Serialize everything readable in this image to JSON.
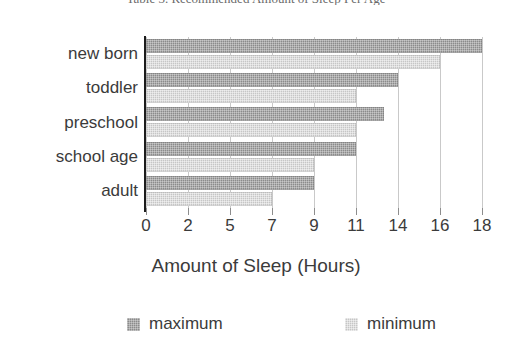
{
  "chart_data": {
    "type": "bar",
    "orientation": "horizontal",
    "title": "Table 3. Recommended Amount of Sleep Per Age",
    "xlabel": "Amount of Sleep (Hours)",
    "ylabel": "",
    "categories": [
      "new born",
      "toddler",
      "preschool",
      "school age",
      "adult"
    ],
    "series": [
      {
        "name": "maximum",
        "values": [
          18,
          14,
          13,
          11,
          9
        ],
        "color": "#8b8b8b"
      },
      {
        "name": "minimum",
        "values": [
          16,
          11,
          11,
          9,
          7
        ],
        "color": "#c6c6c6"
      }
    ],
    "xtick_labels": [
      "0",
      "2",
      "5",
      "7",
      "9",
      "11",
      "14",
      "16",
      "18"
    ],
    "xtick_values": [
      0,
      2,
      5,
      7,
      9,
      11,
      14,
      16,
      18
    ],
    "xaxis_scale": "categorical-evenly-spaced",
    "xlim": [
      0,
      18
    ],
    "grid": true,
    "grid_axis": "x",
    "legend_position": "bottom",
    "legend_entries": [
      "maximum",
      "minimum"
    ]
  }
}
